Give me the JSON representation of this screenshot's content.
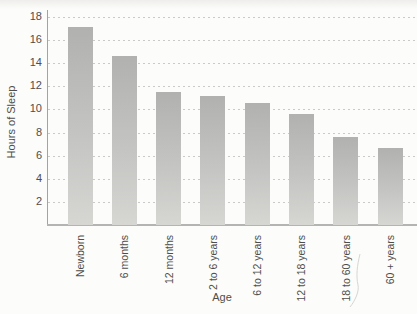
{
  "chart_data": {
    "type": "bar",
    "title": "",
    "xlabel": "Age",
    "ylabel": "Hours of Sleep",
    "categories": [
      "Newborn",
      "6 months",
      "12 months",
      "2 to 6 years",
      "6 to 12 years",
      "12 to 18 years",
      "18 to 60 years",
      "60 + years"
    ],
    "values": [
      17.1,
      14.6,
      11.5,
      11.2,
      10.6,
      9.6,
      7.6,
      6.7
    ],
    "yticks": [
      2,
      4,
      6,
      8,
      10,
      12,
      14,
      16,
      18
    ],
    "ylim": [
      0,
      18.6
    ],
    "grid": "horizontal-dashed",
    "legend": "none",
    "colors": {
      "bar_top": "#b1b1af",
      "bar_bottom": "#d6d6d3",
      "gridline": "#cacac8",
      "axis_line": "#a3a3a1",
      "baseline": "#b4b4b2",
      "text": "#4e4e4c",
      "background": "#fcfcfa"
    }
  }
}
